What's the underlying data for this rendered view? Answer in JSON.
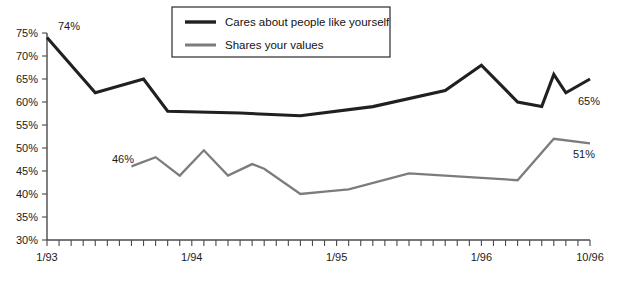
{
  "chart_data": {
    "type": "line",
    "title": "",
    "subtitle": "",
    "xlabel": "",
    "ylabel": "",
    "grid": false,
    "legend_position": "top-center",
    "ylim": [
      30,
      75
    ],
    "ytick_labels": [
      "75%",
      "70%",
      "65%",
      "60%",
      "55%",
      "50%",
      "45%",
      "40%",
      "35%",
      "30%"
    ],
    "ytick_values": [
      75,
      70,
      65,
      60,
      55,
      50,
      45,
      40,
      35,
      30
    ],
    "xtick_labels": [
      "1/93",
      "1/94",
      "1/95",
      "1/96",
      "10/96"
    ],
    "xtick_values": [
      0,
      12,
      24,
      36,
      45
    ],
    "x_minor_tick_count": 45,
    "x_axis_note": "monthly minor ticks from 1/93 through 10/96",
    "series": [
      {
        "name": "Cares about people like yourself",
        "color": "#231f20",
        "x": [
          0,
          4,
          8,
          10,
          16,
          21,
          27,
          33,
          36,
          39,
          41,
          42,
          43,
          45
        ],
        "values": [
          74,
          62,
          65,
          58,
          57.6,
          57,
          59,
          62.5,
          68,
          60,
          59,
          66,
          62,
          65
        ],
        "start_label": "74%",
        "end_label": "65%"
      },
      {
        "name": "Shares your values",
        "color": "#7c7c7c",
        "x": [
          7,
          9,
          11,
          13,
          15,
          17,
          18,
          21,
          23,
          25,
          30,
          36,
          39,
          42,
          45
        ],
        "values": [
          46,
          48,
          44,
          49.5,
          44,
          46.5,
          45.5,
          40,
          40.5,
          41,
          44.5,
          43.5,
          43,
          52,
          51
        ],
        "start_label": "46%",
        "end_label": "51%"
      }
    ],
    "annotations": [
      {
        "name": "dark-start",
        "text": "74%",
        "x_px": 58,
        "y_px": 30,
        "anchor": "start"
      },
      {
        "name": "dark-end",
        "text": "65%",
        "x_px": 578,
        "y_px": 105,
        "anchor": "start"
      },
      {
        "name": "gray-start",
        "text": "46%",
        "x_px": 112,
        "y_px": 163,
        "anchor": "start"
      },
      {
        "name": "gray-end",
        "text": "51%",
        "x_px": 573,
        "y_px": 158,
        "anchor": "start"
      }
    ]
  },
  "legend": {
    "items": [
      {
        "label": "Cares about people like yourself",
        "color": "#231f20",
        "swatch": "line-swatch-dark"
      },
      {
        "label": "Shares your values",
        "color": "#7c7c7c",
        "swatch": "line-swatch-gray"
      }
    ]
  },
  "axes": {
    "y_labels": [
      "75%",
      "70%",
      "65%",
      "60%",
      "55%",
      "50%",
      "45%",
      "40%",
      "35%",
      "30%"
    ],
    "x_labels": [
      "1/93",
      "1/94",
      "1/95",
      "1/96",
      "10/96"
    ]
  }
}
